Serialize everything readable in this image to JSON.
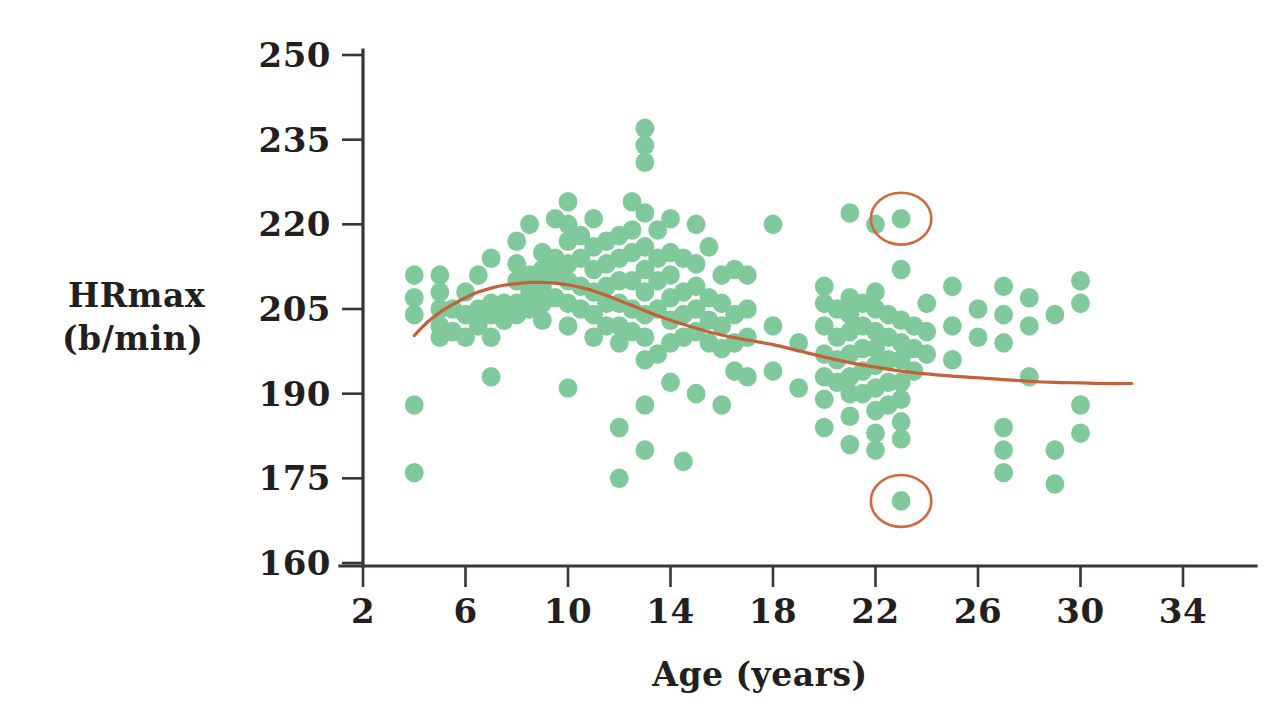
{
  "chart_data": {
    "type": "scatter",
    "title": "",
    "xlabel": "Age (years)",
    "ylabel_line1": "HRmax",
    "ylabel_line2": "(b/min)",
    "xlim": [
      2,
      35
    ],
    "ylim": [
      160,
      250
    ],
    "xticks": [
      2,
      6,
      10,
      14,
      18,
      22,
      26,
      30,
      34
    ],
    "xtick_labels": [
      "2",
      "6",
      "10",
      "14",
      "18",
      "22",
      "26",
      "30",
      "34"
    ],
    "yticks": [
      160,
      175,
      190,
      205,
      220,
      235,
      250
    ],
    "ytick_labels": [
      "160",
      "175",
      "190",
      "205",
      "220",
      "235",
      "250"
    ],
    "grid": false,
    "legend": "none",
    "series": [
      {
        "name": "HRmax observations",
        "marker": "filled-circle",
        "color": "#7fc99a",
        "points": [
          [
            4,
            211
          ],
          [
            4,
            207
          ],
          [
            4,
            204
          ],
          [
            4,
            188
          ],
          [
            4,
            176
          ],
          [
            5,
            211
          ],
          [
            5,
            208
          ],
          [
            5,
            205
          ],
          [
            5,
            202
          ],
          [
            5,
            200
          ],
          [
            5.5,
            205
          ],
          [
            5.5,
            201
          ],
          [
            6,
            208
          ],
          [
            6,
            204
          ],
          [
            6,
            200
          ],
          [
            6.5,
            211
          ],
          [
            6.5,
            205
          ],
          [
            6.5,
            202
          ],
          [
            7,
            214
          ],
          [
            7,
            206
          ],
          [
            7,
            204
          ],
          [
            7,
            200
          ],
          [
            7,
            193
          ],
          [
            7.5,
            206
          ],
          [
            7.5,
            203
          ],
          [
            8,
            217
          ],
          [
            8,
            213
          ],
          [
            8,
            210
          ],
          [
            8,
            206
          ],
          [
            8,
            204
          ],
          [
            8.5,
            220
          ],
          [
            8.5,
            211
          ],
          [
            8.5,
            208
          ],
          [
            8.5,
            205
          ],
          [
            9,
            215
          ],
          [
            9,
            212
          ],
          [
            9,
            209
          ],
          [
            9,
            206
          ],
          [
            9,
            203
          ],
          [
            9.5,
            221
          ],
          [
            9.5,
            214
          ],
          [
            9.5,
            211
          ],
          [
            9.5,
            207
          ],
          [
            10,
            224
          ],
          [
            10,
            220
          ],
          [
            10,
            217
          ],
          [
            10,
            213
          ],
          [
            10,
            210
          ],
          [
            10,
            206
          ],
          [
            10,
            202
          ],
          [
            10,
            191
          ],
          [
            10.5,
            218
          ],
          [
            10.5,
            214
          ],
          [
            10.5,
            209
          ],
          [
            10.5,
            205
          ],
          [
            11,
            221
          ],
          [
            11,
            216
          ],
          [
            11,
            212
          ],
          [
            11,
            208
          ],
          [
            11,
            204
          ],
          [
            11,
            200
          ],
          [
            11.5,
            217
          ],
          [
            11.5,
            213
          ],
          [
            11.5,
            209
          ],
          [
            11.5,
            206
          ],
          [
            11.5,
            202
          ],
          [
            12,
            218
          ],
          [
            12,
            214
          ],
          [
            12,
            210
          ],
          [
            12,
            206
          ],
          [
            12,
            202
          ],
          [
            12,
            199
          ],
          [
            12,
            184
          ],
          [
            12,
            175
          ],
          [
            12.5,
            224
          ],
          [
            12.5,
            219
          ],
          [
            12.5,
            215
          ],
          [
            12.5,
            210
          ],
          [
            12.5,
            205
          ],
          [
            12.5,
            201
          ],
          [
            13,
            237
          ],
          [
            13,
            234
          ],
          [
            13,
            231
          ],
          [
            13,
            222
          ],
          [
            13,
            216
          ],
          [
            13,
            212
          ],
          [
            13,
            208
          ],
          [
            13,
            204
          ],
          [
            13,
            200
          ],
          [
            13,
            196
          ],
          [
            13,
            188
          ],
          [
            13,
            180
          ],
          [
            13.5,
            219
          ],
          [
            13.5,
            214
          ],
          [
            13.5,
            210
          ],
          [
            13.5,
            205
          ],
          [
            13.5,
            197
          ],
          [
            14,
            221
          ],
          [
            14,
            215
          ],
          [
            14,
            211
          ],
          [
            14,
            207
          ],
          [
            14,
            203
          ],
          [
            14,
            199
          ],
          [
            14,
            192
          ],
          [
            14.5,
            214
          ],
          [
            14.5,
            208
          ],
          [
            14.5,
            204
          ],
          [
            14.5,
            200
          ],
          [
            14.5,
            178
          ],
          [
            15,
            220
          ],
          [
            15,
            213
          ],
          [
            15,
            209
          ],
          [
            15,
            205
          ],
          [
            15,
            201
          ],
          [
            15,
            190
          ],
          [
            15.5,
            216
          ],
          [
            15.5,
            207
          ],
          [
            15.5,
            203
          ],
          [
            15.5,
            199
          ],
          [
            16,
            211
          ],
          [
            16,
            206
          ],
          [
            16,
            202
          ],
          [
            16,
            198
          ],
          [
            16,
            188
          ],
          [
            16.5,
            212
          ],
          [
            16.5,
            204
          ],
          [
            16.5,
            199
          ],
          [
            16.5,
            194
          ],
          [
            17,
            211
          ],
          [
            17,
            205
          ],
          [
            17,
            200
          ],
          [
            17,
            193
          ],
          [
            18,
            220
          ],
          [
            18,
            202
          ],
          [
            18,
            194
          ],
          [
            19,
            199
          ],
          [
            19,
            191
          ],
          [
            20,
            209
          ],
          [
            20,
            206
          ],
          [
            20,
            202
          ],
          [
            20,
            197
          ],
          [
            20,
            193
          ],
          [
            20,
            189
          ],
          [
            20,
            184
          ],
          [
            20.5,
            205
          ],
          [
            20.5,
            200
          ],
          [
            20.5,
            196
          ],
          [
            20.5,
            192
          ],
          [
            21,
            222
          ],
          [
            21,
            207
          ],
          [
            21,
            204
          ],
          [
            21,
            201
          ],
          [
            21,
            197
          ],
          [
            21,
            193
          ],
          [
            21,
            190
          ],
          [
            21,
            186
          ],
          [
            21,
            181
          ],
          [
            21.5,
            206
          ],
          [
            21.5,
            202
          ],
          [
            21.5,
            198
          ],
          [
            21.5,
            194
          ],
          [
            21.5,
            190
          ],
          [
            22,
            220
          ],
          [
            22,
            208
          ],
          [
            22,
            205
          ],
          [
            22,
            201
          ],
          [
            22,
            198
          ],
          [
            22,
            195
          ],
          [
            22,
            191
          ],
          [
            22,
            187
          ],
          [
            22,
            183
          ],
          [
            22,
            180
          ],
          [
            22.5,
            204
          ],
          [
            22.5,
            200
          ],
          [
            22.5,
            196
          ],
          [
            22.5,
            192
          ],
          [
            22.5,
            188
          ],
          [
            23,
            221
          ],
          [
            23,
            212
          ],
          [
            23,
            203
          ],
          [
            23,
            199
          ],
          [
            23,
            196
          ],
          [
            23,
            192
          ],
          [
            23,
            189
          ],
          [
            23,
            185
          ],
          [
            23,
            182
          ],
          [
            23,
            171
          ],
          [
            23.5,
            202
          ],
          [
            23.5,
            198
          ],
          [
            23.5,
            194
          ],
          [
            24,
            206
          ],
          [
            24,
            201
          ],
          [
            24,
            197
          ],
          [
            25,
            209
          ],
          [
            25,
            202
          ],
          [
            25,
            196
          ],
          [
            26,
            205
          ],
          [
            26,
            200
          ],
          [
            27,
            209
          ],
          [
            27,
            204
          ],
          [
            27,
            199
          ],
          [
            27,
            184
          ],
          [
            27,
            180
          ],
          [
            27,
            176
          ],
          [
            28,
            207
          ],
          [
            28,
            202
          ],
          [
            28,
            193
          ],
          [
            29,
            204
          ],
          [
            29,
            180
          ],
          [
            29,
            174
          ],
          [
            30,
            210
          ],
          [
            30,
            206
          ],
          [
            30,
            188
          ],
          [
            30,
            183
          ]
        ]
      }
    ],
    "trend_line": {
      "name": "fitted curve",
      "color": "#c4603a",
      "points": [
        [
          4.0,
          200.3
        ],
        [
          4.5,
          202.6
        ],
        [
          5.0,
          204.4
        ],
        [
          5.5,
          205.8
        ],
        [
          6.0,
          207.0
        ],
        [
          6.5,
          208.0
        ],
        [
          7.0,
          208.7
        ],
        [
          7.5,
          209.2
        ],
        [
          8.0,
          209.5
        ],
        [
          8.5,
          209.7
        ],
        [
          9.0,
          209.7
        ],
        [
          9.5,
          209.6
        ],
        [
          10.0,
          209.3
        ],
        [
          10.5,
          208.8
        ],
        [
          11.0,
          208.2
        ],
        [
          11.5,
          207.4
        ],
        [
          12.0,
          206.5
        ],
        [
          12.5,
          205.6
        ],
        [
          13.0,
          204.7
        ],
        [
          13.5,
          203.8
        ],
        [
          14.0,
          203.0
        ],
        [
          15.0,
          201.6
        ],
        [
          16.0,
          200.4
        ],
        [
          17.0,
          199.5
        ],
        [
          18.0,
          198.7
        ],
        [
          19.0,
          197.6
        ],
        [
          20.0,
          196.5
        ],
        [
          21.0,
          195.5
        ],
        [
          22.0,
          194.7
        ],
        [
          23.0,
          194.0
        ],
        [
          24.0,
          193.5
        ],
        [
          25.0,
          193.1
        ],
        [
          26.0,
          192.8
        ],
        [
          27.0,
          192.5
        ],
        [
          28.0,
          192.2
        ],
        [
          29.0,
          192.0
        ],
        [
          30.0,
          191.9
        ],
        [
          31.0,
          191.8
        ],
        [
          32.0,
          191.8
        ]
      ]
    },
    "annotations": [
      {
        "name": "upper-outlier-circle",
        "shape": "ellipse",
        "x": 23,
        "y": 221,
        "rx": 1.18,
        "ry": 4.6,
        "color": "#cf6a3d"
      },
      {
        "name": "lower-outlier-circle",
        "shape": "ellipse",
        "x": 23,
        "y": 171,
        "rx": 1.18,
        "ry": 4.6,
        "color": "#cf6a3d"
      }
    ]
  },
  "colors": {
    "dot": "#7fc99a",
    "trend": "#c4603a",
    "highlight": "#cf6a3d",
    "axis": "#3a3534",
    "text": "#231f1e",
    "background": "#ffffff"
  }
}
